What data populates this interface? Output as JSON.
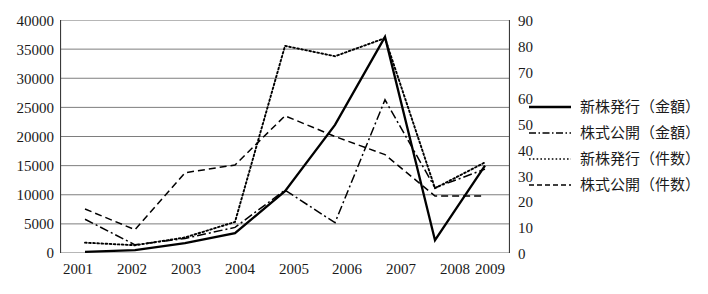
{
  "chart_data": {
    "type": "line",
    "title": "",
    "xlabel": "",
    "ylabel_left": "",
    "ylabel_right": "",
    "grid": true,
    "legend_position": "right",
    "categories": [
      "2001",
      "2002",
      "2003",
      "2004",
      "2005",
      "2006",
      "2007",
      "2008",
      "2009"
    ],
    "left_axis": {
      "min": 0,
      "max": 40000,
      "step": 5000,
      "ticks": [
        "0",
        "5000",
        "10000",
        "15000",
        "20000",
        "25000",
        "30000",
        "35000",
        "40000"
      ]
    },
    "right_axis": {
      "min": 0,
      "max": 90,
      "step": 10,
      "ticks": [
        "0",
        "10",
        "20",
        "30",
        "40",
        "50",
        "60",
        "70",
        "80",
        "90"
      ]
    },
    "series": [
      {
        "name": "新株発行（金額）",
        "axis": "left",
        "style": "solid",
        "color": "#000000",
        "values": [
          200,
          500,
          1700,
          3400,
          10600,
          22000,
          37100,
          2200,
          15000
        ]
      },
      {
        "name": "株式公開（金額）",
        "axis": "left",
        "style": "dashdot",
        "color": "#000000",
        "values": [
          5800,
          1400,
          2500,
          4400,
          10800,
          5200,
          26300,
          11200,
          14400
        ]
      },
      {
        "name": "新株発行（件数）",
        "axis": "right",
        "style": "dotted",
        "color": "#000000",
        "values": [
          4,
          3,
          6,
          12,
          80,
          76,
          83,
          25,
          35
        ]
      },
      {
        "name": "株式公開（件数）",
        "axis": "right",
        "style": "dashed",
        "color": "#000000",
        "values": [
          17,
          9,
          31,
          34,
          53,
          45,
          38,
          22,
          22
        ]
      }
    ]
  }
}
